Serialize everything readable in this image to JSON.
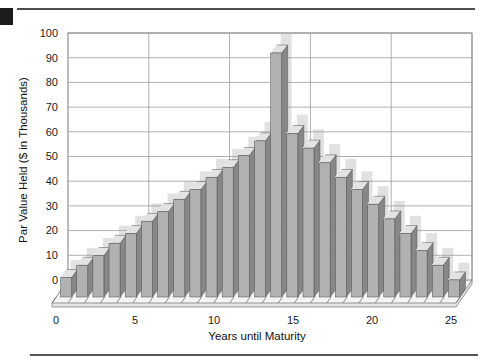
{
  "chart_data": {
    "type": "bar",
    "style": "3d-column",
    "title": "",
    "xlabel": "Years until Maturity",
    "ylabel": "Par Value Held ($ in Thousands)",
    "x": [
      1,
      2,
      3,
      4,
      5,
      6,
      7,
      8,
      9,
      10,
      11,
      12,
      13,
      14,
      15,
      16,
      17,
      18,
      19,
      20,
      21,
      22,
      23,
      24,
      25
    ],
    "values": [
      8,
      13,
      17,
      22,
      26,
      31,
      35,
      40,
      44,
      49,
      53,
      58,
      64,
      100,
      67,
      61,
      55,
      49,
      44,
      38,
      32,
      26,
      19,
      13,
      7
    ],
    "ylim": [
      0,
      100
    ],
    "yticks": [
      0,
      10,
      20,
      30,
      40,
      50,
      60,
      70,
      80,
      90,
      100
    ],
    "xticks": [
      0,
      5,
      10,
      15,
      20,
      25
    ],
    "grid": true,
    "legend": null,
    "colors": {
      "bar_front": "#b1b1b1",
      "bar_side": "#878787",
      "bar_top": "#e3e3e3",
      "bar_outline": "#4e4e4e",
      "bar_highlight": "#ffffff",
      "wall_shadow": "#c9c9c9",
      "gridline": "#9c9c9c",
      "wall_border": "#7d7d7d",
      "floor_fill": "#f4f4f4",
      "floor_slab": "#e6e6e6",
      "tick_text": "#1b1b1b"
    }
  }
}
